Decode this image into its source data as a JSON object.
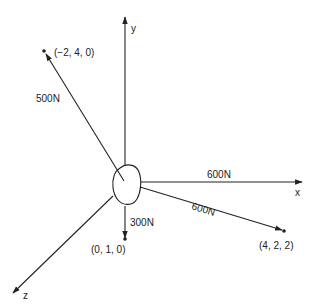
{
  "diagram": {
    "type": "3D force diagram",
    "colors": {
      "line": "#222222",
      "background": "#ffffff"
    },
    "axes": {
      "x": {
        "label": "x"
      },
      "y": {
        "label": "y"
      },
      "z": {
        "label": "z"
      }
    },
    "body": {
      "name": "rigid body (blob) at origin"
    },
    "forces": [
      {
        "magnitude_label": "500N",
        "point_label": "(−2, 4, 0)",
        "direction": "toward (-2, 4, 0)"
      },
      {
        "magnitude_label": "600N",
        "point_label": "",
        "direction": "along +x axis"
      },
      {
        "magnitude_label": "600N",
        "point_label": "(4, 2, 2)",
        "direction": "toward (4, 2, 2)"
      },
      {
        "magnitude_label": "300N",
        "point_label": "(0, 1, 0)",
        "direction": "downward (−y)"
      }
    ]
  }
}
